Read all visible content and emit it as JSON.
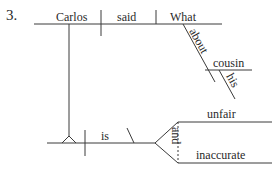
{
  "exercise_number": "3.",
  "diagram": {
    "type": "sentence-diagram",
    "main_clause": {
      "subject": "Carlos",
      "verb": "said",
      "direct_object": "What",
      "modifiers": {
        "preposition": "about",
        "object_of_preposition": "cousin",
        "possessive": "his"
      }
    },
    "noun_clause": {
      "verb": "is",
      "conjunction": "and",
      "predicate_adjectives": [
        "unfair",
        "inaccurate"
      ]
    }
  },
  "colors": {
    "line": "#3a3a3a",
    "text": "#2a2a2a",
    "background": "#ffffff"
  }
}
